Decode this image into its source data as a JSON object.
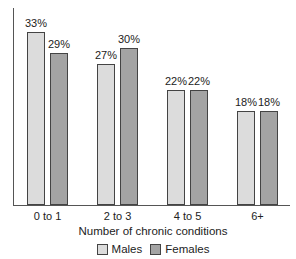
{
  "chart_data": {
    "type": "bar",
    "title": "",
    "xlabel": "Number of chronic conditions",
    "ylabel": "",
    "categories": [
      "0 to 1",
      "2 to 3",
      "4 to 5",
      "6+"
    ],
    "series": [
      {
        "name": "Males",
        "values": [
          33,
          27,
          22,
          18
        ],
        "labels": [
          "33%",
          "27%",
          "22%",
          "18%"
        ],
        "color": "#dcdcdc"
      },
      {
        "name": "Females",
        "values": [
          29,
          30,
          22,
          18
        ],
        "labels": [
          "29%",
          "30%",
          "22%",
          "18%"
        ],
        "color": "#a4a4a4"
      }
    ],
    "ylim": [
      0,
      37
    ],
    "grid": false,
    "legend_position": "bottom",
    "value_labels": true
  }
}
